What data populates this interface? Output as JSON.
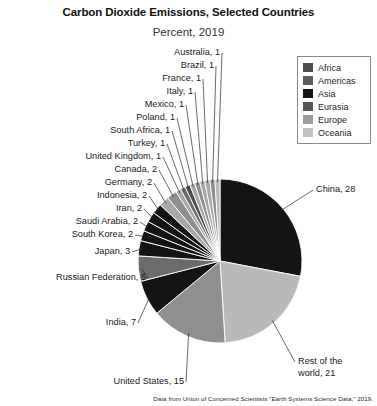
{
  "header": {
    "title": "Carbon Dioxide Emissions, Selected Countries",
    "subtitle": "Percent, 2019"
  },
  "source": {
    "note": "Data from Union of Concerned Scientists \"Earth Systems Science Data,\" 2019."
  },
  "legend": {
    "position": "top-right",
    "items": [
      {
        "label": "Africa",
        "color": "#4d4d4d"
      },
      {
        "label": "Americas",
        "color": "#5e5e5e"
      },
      {
        "label": "Asia",
        "color": "#141414"
      },
      {
        "label": "Eurasia",
        "color": "#565656"
      },
      {
        "label": "Europe",
        "color": "#9c9c9c"
      },
      {
        "label": "Oceania",
        "color": "#c2c2c2"
      }
    ]
  },
  "chart_data": {
    "type": "pie",
    "title": "Carbon Dioxide Emissions, Selected Countries",
    "subtitle": "Percent, 2019",
    "unit": "percent",
    "start_angle_deg": 0,
    "direction": "clockwise",
    "total": 100,
    "categories": [
      "China",
      "Rest of the world",
      "United States",
      "India",
      "Russian Federation",
      "Japan",
      "South Korea",
      "Saudi Arabia",
      "Iran",
      "Indonesia",
      "Germany",
      "Canada",
      "United Kingdom",
      "Turkey",
      "South Africa",
      "Poland",
      "Mexico",
      "Italy",
      "France",
      "Brazil",
      "Australia"
    ],
    "values": [
      28,
      21,
      15,
      7,
      5,
      3,
      2,
      2,
      2,
      2,
      2,
      2,
      1,
      1,
      1,
      1,
      1,
      1,
      1,
      1,
      1
    ],
    "region": [
      "Asia",
      "Oceania",
      "Americas",
      "Asia",
      "Eurasia",
      "Asia",
      "Asia",
      "Asia",
      "Asia",
      "Asia",
      "Europe",
      "Americas",
      "Europe",
      "Eurasia",
      "Africa",
      "Europe",
      "Americas",
      "Europe",
      "Europe",
      "Americas",
      "Oceania"
    ],
    "colors": [
      "#141414",
      "#b9b9b9",
      "#8f8f8f",
      "#141414",
      "#6b6b6b",
      "#141414",
      "#141414",
      "#141414",
      "#141414",
      "#141414",
      "#a8a8a8",
      "#8f8f8f",
      "#a8a8a8",
      "#6b6b6b",
      "#4d4d4d",
      "#a8a8a8",
      "#8f8f8f",
      "#a8a8a8",
      "#a8a8a8",
      "#8f8f8f",
      "#b9b9b9"
    ],
    "data_labels": [
      "China, 28",
      "Rest of the world, 21",
      "United States, 15",
      "India, 7",
      "Russian Federation, 5",
      "Japan, 3",
      "South Korea, 2",
      "Saudi Arabia, 2",
      "Iran, 2",
      "Indonesia, 2",
      "Germany, 2",
      "Canada, 2",
      "United Kingdom, 1",
      "Turkey, 1",
      "South Africa, 1",
      "Poland, 1",
      "Mexico, 1",
      "Italy, 1",
      "France, 1",
      "Brazil, 1",
      "Australia, 1"
    ],
    "legend": [
      "Africa",
      "Americas",
      "Asia",
      "Eurasia",
      "Europe",
      "Oceania"
    ],
    "grid": false
  },
  "labels": [
    {
      "text": "Australia, 1",
      "x": 108,
      "y": 47,
      "w": 112,
      "align": "right"
    },
    {
      "text": "Brazil, 1",
      "x": 108,
      "y": 60,
      "w": 106,
      "align": "right"
    },
    {
      "text": "France, 1",
      "x": 88,
      "y": 73,
      "w": 113,
      "align": "right"
    },
    {
      "text": "Italy, 1",
      "x": 88,
      "y": 86,
      "w": 105,
      "align": "right"
    },
    {
      "text": "Mexico, 1",
      "x": 68,
      "y": 99,
      "w": 116,
      "align": "right"
    },
    {
      "text": "Poland, 1",
      "x": 63,
      "y": 112,
      "w": 112,
      "align": "right"
    },
    {
      "text": "South Africa, 1",
      "x": 43,
      "y": 125,
      "w": 127,
      "align": "right"
    },
    {
      "text": "Turkey, 1",
      "x": 63,
      "y": 138,
      "w": 102,
      "align": "right"
    },
    {
      "text": "United Kingdom, 1",
      "x": 18,
      "y": 151,
      "w": 143,
      "align": "right"
    },
    {
      "text": "Canada, 2",
      "x": 48,
      "y": 164,
      "w": 109,
      "align": "right"
    },
    {
      "text": "Germany, 2",
      "x": 38,
      "y": 177,
      "w": 114,
      "align": "right"
    },
    {
      "text": "Indonesia, 2",
      "x": 30,
      "y": 190,
      "w": 117,
      "align": "right"
    },
    {
      "text": "Iran, 2",
      "x": 44,
      "y": 203,
      "w": 98,
      "align": "right"
    },
    {
      "text": "Saudi Arabia, 2",
      "x": 13,
      "y": 216,
      "w": 125,
      "align": "right"
    },
    {
      "text": "South Korea, 2",
      "x": 9,
      "y": 229,
      "w": 124,
      "align": "right"
    },
    {
      "text": "Japan, 3",
      "x": 28,
      "y": 246,
      "w": 102,
      "align": "right"
    },
    {
      "text": "Russian Federation, 5",
      "x": 4,
      "y": 272,
      "w": 142,
      "align": "right"
    },
    {
      "text": "India, 7",
      "x": 38,
      "y": 317,
      "w": 98,
      "align": "right"
    },
    {
      "text": "United States, 15",
      "x": 64,
      "y": 376,
      "w": 120,
      "align": "right"
    },
    {
      "text": "China, 28",
      "x": 316,
      "y": 184,
      "w": 58,
      "align": "left"
    },
    {
      "text": "Rest of the",
      "x": 298,
      "y": 356,
      "w": 70,
      "align": "left"
    },
    {
      "text": "world, 21",
      "x": 298,
      "y": 368,
      "w": 70,
      "align": "left"
    }
  ],
  "geometry": {
    "center_x": 220,
    "center_y": 261,
    "radius": 82
  }
}
